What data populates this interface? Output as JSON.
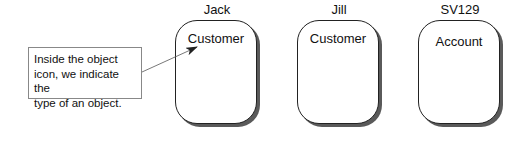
{
  "diagram": {
    "callout": {
      "lines": [
        "Inside the object",
        "icon, we indicate the",
        "type of an object."
      ]
    },
    "objects": [
      {
        "name": "Jack",
        "type": "Customer"
      },
      {
        "name": "Jill",
        "type": "Customer"
      },
      {
        "name": "SV129",
        "type": "Account"
      }
    ],
    "arrow": {
      "from": "callout",
      "to": "objects.0.type",
      "color": "#333333"
    },
    "colors": {
      "border": "#222222",
      "shadow": "#5a5a5a",
      "callout_border": "#888888",
      "background": "#ffffff"
    }
  }
}
